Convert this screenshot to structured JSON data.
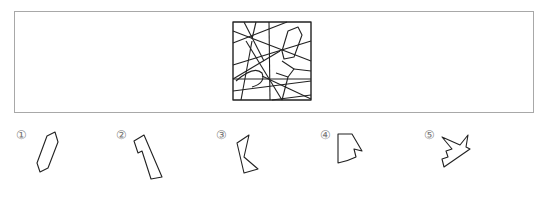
{
  "header": {
    "cut_off_text": ""
  },
  "puzzle": {
    "description": "Square containing overlapping line segments; find which shape is hidden in it",
    "stroke_color": "#222222",
    "frame_border_color": "#a8a8a8"
  },
  "options": [
    {
      "label": "①",
      "shape": "elongated-hexagon"
    },
    {
      "label": "②",
      "shape": "notched-trapezoid"
    },
    {
      "label": "③",
      "shape": "bent-quadrilateral"
    },
    {
      "label": "④",
      "shape": "notched-fan"
    },
    {
      "label": "⑤",
      "shape": "jagged-star-fragment"
    }
  ]
}
